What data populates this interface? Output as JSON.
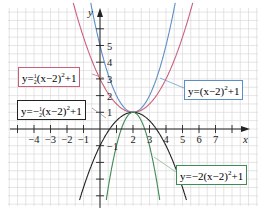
{
  "chart_data": {
    "type": "line",
    "title": "",
    "xlabel": "x",
    "ylabel": "y",
    "xlim": [
      -5.5,
      9.5
    ],
    "ylim": [
      -4.7,
      7.7
    ],
    "grid": true,
    "x_tick_labels": [
      "−4",
      "−3",
      "−2",
      "−1",
      "2",
      "3",
      "4",
      "5",
      "6",
      "7"
    ],
    "y_tick_labels": [
      "5",
      "4",
      "3",
      "2",
      "1",
      "−1"
    ],
    "series": [
      {
        "name": "y=(x−2)²+1",
        "formula": "(x-2)^2+1",
        "a": 1,
        "h": 2,
        "k": 1,
        "color": "#5b8fc7"
      },
      {
        "name": "y=½(x−2)²+1",
        "formula": "0.5*(x-2)^2+1",
        "a": 0.5,
        "h": 2,
        "k": 1,
        "color": "#c9607a"
      },
      {
        "name": "y=−½(x−2)²+1",
        "formula": "-0.5*(x-2)^2+1",
        "a": -0.5,
        "h": 2,
        "k": 1,
        "color": "#222222"
      },
      {
        "name": "y=−2(x−2)²+1",
        "formula": "-2*(x-2)^2+1",
        "a": -2,
        "h": 2,
        "k": 1,
        "color": "#3f8a55"
      }
    ],
    "vertex": [
      2,
      1
    ]
  },
  "labels": {
    "half_pos": {
      "prefix": "y=",
      "frac_num": "1",
      "frac_den": "2",
      "body": "(x−2)",
      "exp": "2",
      "suffix": "+1"
    },
    "unit_pos": {
      "prefix": "y=",
      "body": "(x−2)",
      "exp": "2",
      "suffix": "+1"
    },
    "half_neg": {
      "prefix": "y=−",
      "frac_num": "1",
      "frac_den": "2",
      "body": "(x−2)",
      "exp": "2",
      "suffix": "+1"
    },
    "two_neg": {
      "prefix": "y=−2",
      "body": "(x−2)",
      "exp": "2",
      "suffix": "+1"
    }
  },
  "axes": {
    "x_name": "x",
    "y_name": "y"
  }
}
